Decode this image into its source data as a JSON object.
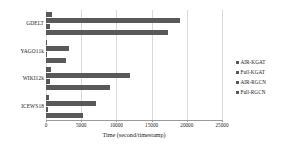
{
  "chart_data": {
    "type": "bar",
    "orientation": "horizontal",
    "title": "",
    "xlabel": "Time (second/timestamp)",
    "ylabel": "",
    "xlim": [
      0,
      25000
    ],
    "xticks": [
      0,
      5000,
      10000,
      15000,
      20000,
      25000
    ],
    "xtick_labels": [
      "0",
      "5000",
      "10000",
      "15000",
      "20000",
      "25000"
    ],
    "grid": true,
    "grid_axis": "x",
    "legend_position": "right",
    "categories": [
      "GDELT",
      "YAGO11k",
      "WIKI12k",
      "ICEWS18"
    ],
    "series": [
      {
        "name": "AIR-KGAT",
        "color": "#595959",
        "values": [
          800,
          150,
          700,
          400
        ]
      },
      {
        "name": "Full-KGAT",
        "color": "#595959",
        "values": [
          19000,
          3200,
          12000,
          7100
        ]
      },
      {
        "name": "AIR-RGCN",
        "color": "#595959",
        "values": [
          600,
          100,
          500,
          300
        ]
      },
      {
        "name": "Full-RGCN",
        "color": "#595959",
        "values": [
          17300,
          2800,
          9100,
          5200
        ]
      }
    ]
  },
  "legend": {
    "items": [
      {
        "label": "AIR-KGAT",
        "marker": "square-marker"
      },
      {
        "label": "Full-KGAT",
        "marker": "square-marker"
      },
      {
        "label": "AIR-RGCN",
        "marker": "square-marker"
      },
      {
        "label": "Full-RGCN",
        "marker": "square-marker"
      }
    ]
  },
  "colors": {
    "bar": "#595959",
    "grid": "#d9d9d9",
    "axis": "#9a9a9a",
    "text": "#1a1a1a",
    "background": "#ffffff"
  }
}
